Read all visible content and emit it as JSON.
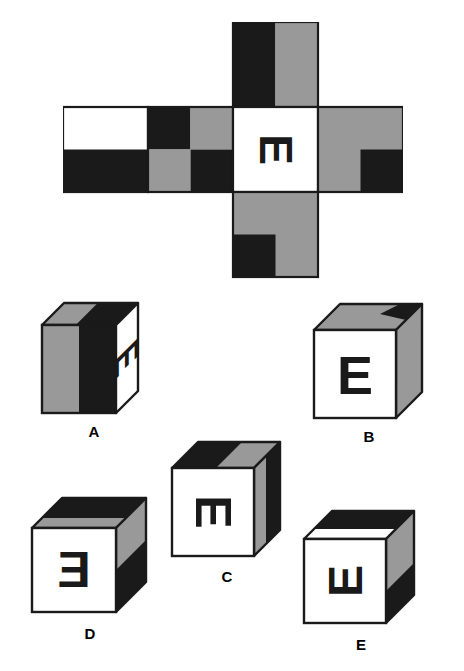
{
  "puzzle": {
    "type": "cube-folding-spatial-reasoning",
    "letter_on_net": "E",
    "colors": {
      "black": "#1a1a1a",
      "gray": "#999999",
      "white": "#ffffff",
      "outline": "#1a1a1a",
      "background": "#ffffff"
    }
  },
  "net": {
    "name": "cube-net-cross",
    "description": "Unfolded cube net: a horizontal row of four square faces with one extra square above the fourth column and one extra square below the fourth column.",
    "cell_size": 85,
    "row_faces": [
      {
        "id": "net-face-1",
        "position": "row-col-1",
        "pattern": "half-horizontal",
        "top_half": "white",
        "bottom_half": "black"
      },
      {
        "id": "net-face-2",
        "position": "row-col-2",
        "pattern": "checker-2x2",
        "top_left": "black",
        "top_right": "gray",
        "bottom_left": "gray",
        "bottom_right": "black"
      },
      {
        "id": "net-face-3",
        "position": "row-col-3",
        "pattern": "letter",
        "base": "white",
        "letter": "E",
        "letter_rotation_deg": 90,
        "letter_color": "black"
      },
      {
        "id": "net-face-4",
        "position": "row-col-4",
        "pattern": "quadrant",
        "base": "gray",
        "quadrant": "bottom-right",
        "quadrant_color": "black"
      }
    ],
    "top_face": {
      "id": "net-face-top",
      "position": "above-col-3",
      "pattern": "half-vertical",
      "left_half": "black",
      "right_half": "gray"
    },
    "bottom_face": {
      "id": "net-face-bottom",
      "position": "below-col-3",
      "pattern": "quadrant",
      "base": "gray",
      "quadrant": "bottom-left",
      "quadrant_color": "black"
    }
  },
  "options": [
    {
      "label": "A",
      "name": "option-cube-a",
      "front": {
        "fill": "split-vertical",
        "left": "gray",
        "right": "black"
      },
      "top": {
        "fill": "split",
        "left": "black",
        "right": "gray"
      },
      "right": {
        "fill": "white",
        "letter": "E",
        "letter_rotation_deg": 90
      }
    },
    {
      "label": "B",
      "name": "option-cube-b",
      "front": {
        "fill": "white",
        "letter": "E",
        "letter_rotation_deg": 0
      },
      "top": {
        "fill": "gray",
        "accent": "black",
        "accent_region": "back-right"
      },
      "right": {
        "fill": "gray"
      }
    },
    {
      "label": "C",
      "name": "option-cube-c",
      "front": {
        "fill": "white",
        "letter": "E",
        "letter_rotation_deg": 90
      },
      "top": {
        "fill": "split",
        "left": "black",
        "right": "gray"
      },
      "right": {
        "fill": "gray",
        "accent": "black"
      }
    },
    {
      "label": "D",
      "name": "option-cube-d",
      "front": {
        "fill": "white",
        "letter": "E",
        "letter_rotation_deg": 0,
        "mirrored": true
      },
      "top": {
        "fill": "black",
        "accent": "gray"
      },
      "right": {
        "fill": "split-horizontal",
        "top": "gray",
        "bottom": "black"
      }
    },
    {
      "label": "E",
      "name": "option-cube-e",
      "front": {
        "fill": "white",
        "letter": "E",
        "letter_rotation_deg": -90
      },
      "top": {
        "fill": "black"
      },
      "right": {
        "fill": "gray",
        "accent": "black",
        "accent_region": "lower"
      }
    }
  ]
}
